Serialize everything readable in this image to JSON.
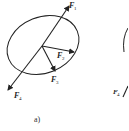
{
  "figure": {
    "caption": "a)",
    "colors": {
      "stroke": "#222222",
      "background": "#ffffff"
    },
    "forces": [
      {
        "name": "F",
        "sub": "1",
        "direction": "up-right along axis"
      },
      {
        "name": "F",
        "sub": "2",
        "direction": "right from center"
      },
      {
        "name": "F",
        "sub": "3",
        "direction": "down-right from center"
      },
      {
        "name": "F",
        "sub": "4",
        "direction": "down-left along axis"
      }
    ],
    "partial_second_figure": {
      "label_name": "F",
      "label_sub": "4"
    }
  }
}
